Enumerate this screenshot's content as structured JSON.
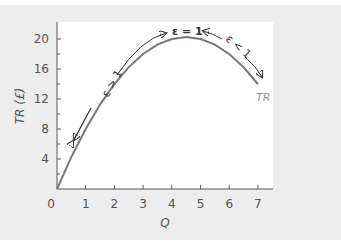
{
  "chart_data": {
    "type": "line",
    "title": "",
    "xlabel": "Q",
    "ylabel": "TR (£)",
    "xlim": [
      0,
      7.5
    ],
    "ylim": [
      0,
      22
    ],
    "x_ticks": [
      "0",
      "1",
      "2",
      "3",
      "4",
      "5",
      "6",
      "7"
    ],
    "y_ticks": [
      "4",
      "8",
      "12",
      "16",
      "20"
    ],
    "grid": false,
    "legend": null,
    "series": [
      {
        "name": "TR",
        "x": [
          0,
          0.5,
          1,
          1.5,
          2,
          2.5,
          3,
          3.5,
          4,
          4.5,
          5,
          5.5,
          6,
          6.5,
          7
        ],
        "values": [
          0,
          4.25,
          8,
          11.25,
          14,
          16.25,
          18,
          19.25,
          20,
          20.25,
          20,
          19.25,
          18,
          16.25,
          14
        ],
        "color": "#777777"
      }
    ],
    "annotations": [
      {
        "text": "ε > 1",
        "region": "elastic",
        "position": "upper-left along rising segment, arrow pointing both ways"
      },
      {
        "text": "ε = 1",
        "region": "unit elastic",
        "position": "at maximum (Q≈4.5)"
      },
      {
        "text": "ε < 1",
        "region": "inelastic",
        "position": "upper-right along falling segment, arrow pointing both ways"
      },
      {
        "text": "TR",
        "position": "curve label near end of curve"
      }
    ]
  },
  "labels": {
    "x_axis": "Q",
    "y_axis": "TR (£)",
    "curve": "TR",
    "elastic": "ε > 1",
    "unit_elastic": "ε = 1",
    "inelastic": "ε < 1",
    "origin": "0"
  },
  "colors": {
    "panel": "#ededed",
    "curve": "#777777",
    "arrow": "#333333",
    "axis": "#555555"
  }
}
